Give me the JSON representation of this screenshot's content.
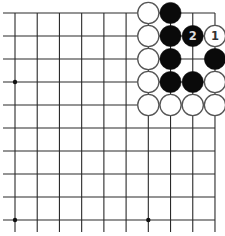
{
  "diagram": {
    "type": "go-board-partial",
    "columns": 10,
    "rows": 10,
    "edges": {
      "top": true,
      "right": true,
      "left": false,
      "bottom": false
    },
    "grid": {
      "x0": 15,
      "dx": 22.22,
      "y0": 13,
      "dy": 23.0,
      "line_color": "#2a2a2a",
      "extend_left_to": 3,
      "extend_bottom_to": 232
    },
    "star_points": [
      {
        "col": 0,
        "row": 3
      },
      {
        "col": 0,
        "row": 9
      },
      {
        "col": 6,
        "row": 9
      }
    ],
    "stones": [
      {
        "col": 6,
        "row": 0,
        "color": "white",
        "label": ""
      },
      {
        "col": 7,
        "row": 0,
        "color": "black",
        "label": ""
      },
      {
        "col": 6,
        "row": 1,
        "color": "white",
        "label": ""
      },
      {
        "col": 7,
        "row": 1,
        "color": "black",
        "label": ""
      },
      {
        "col": 8,
        "row": 1,
        "color": "black",
        "label": "2"
      },
      {
        "col": 9,
        "row": 1,
        "color": "white",
        "label": "1"
      },
      {
        "col": 6,
        "row": 2,
        "color": "white",
        "label": ""
      },
      {
        "col": 7,
        "row": 2,
        "color": "black",
        "label": ""
      },
      {
        "col": 9,
        "row": 2,
        "color": "black",
        "label": ""
      },
      {
        "col": 6,
        "row": 3,
        "color": "white",
        "label": ""
      },
      {
        "col": 7,
        "row": 3,
        "color": "black",
        "label": ""
      },
      {
        "col": 8,
        "row": 3,
        "color": "black",
        "label": ""
      },
      {
        "col": 9,
        "row": 3,
        "color": "white",
        "label": ""
      },
      {
        "col": 6,
        "row": 4,
        "color": "white",
        "label": ""
      },
      {
        "col": 7,
        "row": 4,
        "color": "white",
        "label": ""
      },
      {
        "col": 8,
        "row": 4,
        "color": "white",
        "label": ""
      },
      {
        "col": 9,
        "row": 4,
        "color": "white",
        "label": ""
      }
    ],
    "colors": {
      "black_stone": "#0a0a0a",
      "white_stone_fill": "#ffffff",
      "white_stone_stroke": "#555555",
      "label_on_black": "#dddddd",
      "label_on_white": "#333333"
    },
    "stone_radius": 10.6
  }
}
